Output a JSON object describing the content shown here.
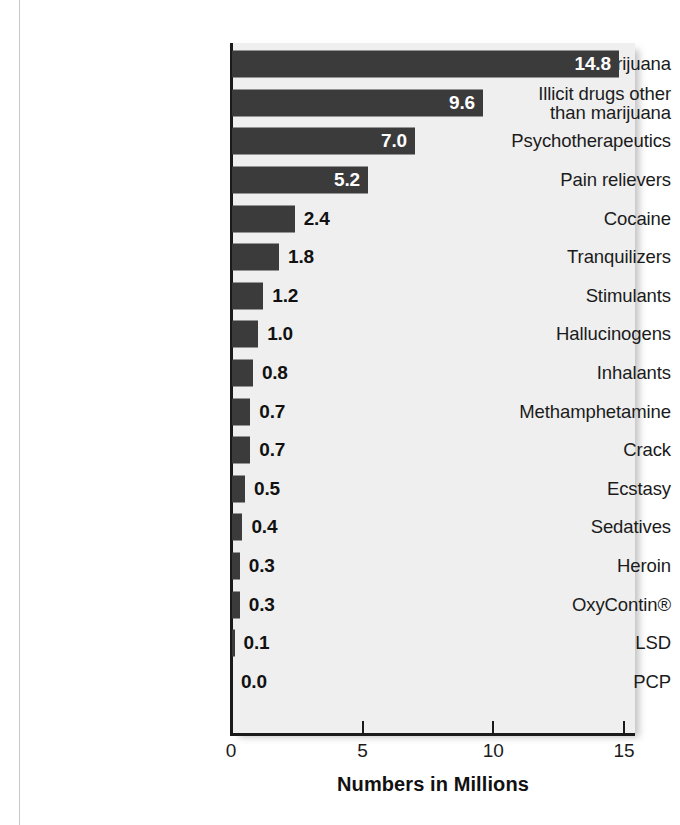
{
  "chart_data": {
    "type": "bar",
    "orientation": "horizontal",
    "title": "",
    "xlabel": "Numbers in Millions",
    "ylabel": "",
    "xlim": [
      0,
      15
    ],
    "xticks": [
      0,
      5,
      10,
      15
    ],
    "xtick_labels": [
      "0",
      "5",
      "10",
      "15"
    ],
    "grid": false,
    "legend": null,
    "categories": [
      "Marijuana",
      "Illicit drugs other than marijuana",
      "Psychotherapeutics",
      "Pain relievers",
      "Cocaine",
      "Tranquilizers",
      "Stimulants",
      "Hallucinogens",
      "Inhalants",
      "Methamphetamine",
      "Crack",
      "Ecstasy",
      "Sedatives",
      "Heroin",
      "OxyContin®",
      "LSD",
      "PCP"
    ],
    "values": [
      14.8,
      9.6,
      7.0,
      5.2,
      2.4,
      1.8,
      1.2,
      1.0,
      0.8,
      0.7,
      0.7,
      0.5,
      0.4,
      0.3,
      0.3,
      0.1,
      0.0
    ],
    "value_labels": [
      "14.8",
      "9.6",
      "7.0",
      "5.2",
      "2.4",
      "1.8",
      "1.2",
      "1.0",
      "0.8",
      "0.7",
      "0.7",
      "0.5",
      "0.4",
      "0.3",
      "0.3",
      "0.1",
      "0.0"
    ],
    "label_placement": [
      "inside",
      "inside",
      "inside",
      "inside",
      "outside",
      "outside",
      "outside",
      "outside",
      "outside",
      "outside",
      "outside",
      "outside",
      "outside",
      "outside",
      "outside",
      "outside",
      "outside"
    ],
    "category_lines": [
      [
        "Marijuana"
      ],
      [
        "Illicit drugs other",
        "than marijuana"
      ],
      [
        "Psychotherapeutics"
      ],
      [
        "Pain relievers"
      ],
      [
        "Cocaine"
      ],
      [
        "Tranquilizers"
      ],
      [
        "Stimulants"
      ],
      [
        "Hallucinogens"
      ],
      [
        "Inhalants"
      ],
      [
        "Methamphetamine"
      ],
      [
        "Crack"
      ],
      [
        "Ecstasy"
      ],
      [
        "Sedatives"
      ],
      [
        "Heroin"
      ],
      [
        "OxyContin®"
      ],
      [
        "LSD"
      ],
      [
        "PCP"
      ]
    ],
    "colors": {
      "bar": "#3b3b3b",
      "plot_background": "#efefef",
      "page_background": "#ffffff",
      "axis": "#1a1a1a",
      "inside_label": "#ffffff",
      "outside_label": "#111111",
      "text": "#1b1b1b"
    }
  }
}
